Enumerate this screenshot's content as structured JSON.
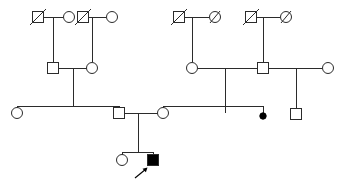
{
  "figure": {
    "kind": "pedigree-chart",
    "title": "",
    "width": 343,
    "height": 183,
    "background_color": "#ffffff",
    "line_color": "#2b2b2b",
    "affected_fill_color": "#000000",
    "unaffected_fill_color": "#ffffff"
  },
  "chart_data": {
    "type": "diagram",
    "diagram_kind": "pedigree",
    "title": "",
    "generations": 4,
    "legend": {
      "square": "male",
      "circle": "female",
      "filled": "affected",
      "open": "unaffected",
      "slash": "deceased",
      "small filled dot": "affected pregnancy loss",
      "arrow": "proband"
    },
    "symbol_size": {
      "square": 11,
      "circle_radius": 5.5,
      "dot_radius": 3.2
    },
    "rows": [
      {
        "id": "gen1",
        "label": "Generation I",
        "y": 17
      },
      {
        "id": "gen2",
        "label": "Generation II",
        "y": 68
      },
      {
        "id": "gen3",
        "label": "Generation III",
        "y": 113
      },
      {
        "id": "gen4",
        "label": "Generation IV",
        "y": 160
      }
    ],
    "nodes": [
      {
        "id": "I-1",
        "sex": "male",
        "shape": "square",
        "affected": false,
        "deceased": true,
        "x": 38,
        "y": 17,
        "generation": 1
      },
      {
        "id": "I-2",
        "sex": "female",
        "shape": "circle",
        "affected": false,
        "deceased": false,
        "x": 69,
        "y": 17,
        "generation": 1
      },
      {
        "id": "I-3",
        "sex": "male",
        "shape": "square",
        "affected": false,
        "deceased": true,
        "x": 83,
        "y": 17,
        "generation": 1
      },
      {
        "id": "I-4",
        "sex": "female",
        "shape": "circle",
        "affected": false,
        "deceased": false,
        "x": 112,
        "y": 17,
        "generation": 1
      },
      {
        "id": "I-5",
        "sex": "male",
        "shape": "square",
        "affected": false,
        "deceased": true,
        "x": 179,
        "y": 17,
        "generation": 1
      },
      {
        "id": "I-6",
        "sex": "female",
        "shape": "circle",
        "affected": false,
        "deceased": true,
        "x": 215,
        "y": 17,
        "generation": 1
      },
      {
        "id": "I-7",
        "sex": "male",
        "shape": "square",
        "affected": false,
        "deceased": true,
        "x": 251,
        "y": 17,
        "generation": 1
      },
      {
        "id": "I-8",
        "sex": "female",
        "shape": "circle",
        "affected": false,
        "deceased": true,
        "x": 286,
        "y": 17,
        "generation": 1
      },
      {
        "id": "II-1",
        "sex": "male",
        "shape": "square",
        "affected": false,
        "deceased": false,
        "x": 53,
        "y": 68,
        "generation": 2
      },
      {
        "id": "II-2",
        "sex": "female",
        "shape": "circle",
        "affected": false,
        "deceased": false,
        "x": 92,
        "y": 68,
        "generation": 2
      },
      {
        "id": "II-3",
        "sex": "female",
        "shape": "circle",
        "affected": false,
        "deceased": false,
        "x": 192,
        "y": 68,
        "generation": 2
      },
      {
        "id": "II-4",
        "sex": "male",
        "shape": "square",
        "affected": false,
        "deceased": false,
        "x": 263,
        "y": 68,
        "generation": 2
      },
      {
        "id": "II-5",
        "sex": "female",
        "shape": "circle",
        "affected": false,
        "deceased": false,
        "x": 328,
        "y": 68,
        "generation": 2
      },
      {
        "id": "III-1",
        "sex": "female",
        "shape": "circle",
        "affected": false,
        "deceased": false,
        "x": 17,
        "y": 113,
        "generation": 3
      },
      {
        "id": "III-2",
        "sex": "male",
        "shape": "square",
        "affected": false,
        "deceased": false,
        "x": 119,
        "y": 113,
        "generation": 3
      },
      {
        "id": "III-3",
        "sex": "female",
        "shape": "circle",
        "affected": false,
        "deceased": false,
        "x": 163,
        "y": 113,
        "generation": 3
      },
      {
        "id": "III-4",
        "sex": "pregnancy-loss",
        "shape": "dot",
        "affected": true,
        "deceased": false,
        "x": 263,
        "y": 116,
        "generation": 3
      },
      {
        "id": "III-5",
        "sex": "male",
        "shape": "square",
        "affected": false,
        "deceased": false,
        "x": 296,
        "y": 114,
        "generation": 3
      },
      {
        "id": "IV-1",
        "sex": "female",
        "shape": "circle",
        "affected": false,
        "deceased": false,
        "x": 122,
        "y": 160,
        "generation": 4
      },
      {
        "id": "IV-2",
        "sex": "male",
        "shape": "square",
        "affected": true,
        "deceased": false,
        "x": 153,
        "y": 160,
        "generation": 4,
        "proband": true
      }
    ],
    "unions": [
      {
        "id": "U1",
        "partners": [
          "I-1",
          "I-2"
        ],
        "children": [
          "II-1"
        ]
      },
      {
        "id": "U2",
        "partners": [
          "I-3",
          "I-4"
        ],
        "children": [
          "II-2"
        ]
      },
      {
        "id": "U3",
        "partners": [
          "I-5",
          "I-6"
        ],
        "children": [
          "II-3"
        ]
      },
      {
        "id": "U4",
        "partners": [
          "I-7",
          "I-8"
        ],
        "children": [
          "II-4"
        ]
      },
      {
        "id": "U5",
        "partners": [
          "II-1",
          "II-2"
        ],
        "children": [
          "III-2"
        ]
      },
      {
        "id": "U6",
        "partners": [
          "II-3",
          "II-4"
        ],
        "children": [
          "III-3",
          "III-4"
        ]
      },
      {
        "id": "U7",
        "partners": [
          "II-4",
          "II-5"
        ],
        "children": [
          "III-5"
        ]
      },
      {
        "id": "U8",
        "partners": [
          "III-1",
          "III-2"
        ],
        "children": []
      },
      {
        "id": "U9",
        "partners": [
          "III-2",
          "III-3"
        ],
        "children": [
          "IV-1",
          "IV-2"
        ]
      }
    ],
    "annotations": [
      {
        "id": "proband-arrow",
        "type": "arrow",
        "points_to": "IV-2",
        "label": "proband",
        "x": 140,
        "y": 177
      }
    ]
  }
}
